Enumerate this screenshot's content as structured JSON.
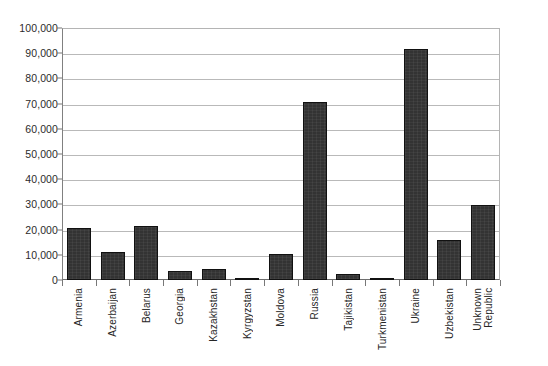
{
  "chart_data": {
    "type": "bar",
    "title": "",
    "subtitle": "",
    "xlabel": "",
    "ylabel": "",
    "ylim": [
      0,
      100000
    ],
    "ytick_step": 10000,
    "grid": true,
    "legend": "none",
    "orientation": "vertical",
    "bar_color": "#333333",
    "bar_border_color": "#111111",
    "gridline_color": "#b9b9b9",
    "axis_color": "#787878",
    "label_color": "#262626",
    "categories": [
      "Armenia",
      "Azerbaijan",
      "Belarus",
      "Georgia",
      "Kazakhstan",
      "Kyrgyzstan",
      "Moldova",
      "Russia",
      "Tajikistan",
      "Turkmenistan",
      "Ukraine",
      "Uzbekistan",
      "Unknown\nRepublic"
    ],
    "values": [
      20800,
      11200,
      21300,
      3700,
      4400,
      900,
      10300,
      70500,
      2500,
      400,
      91800,
      16000,
      29800
    ],
    "ytick_labels": [
      "100,000",
      "90,000",
      "80,000",
      "70,000",
      "60,000",
      "50,000",
      "40,000",
      "30,000",
      "20,000",
      "10,000",
      "0"
    ],
    "ytick_values": [
      100000,
      90000,
      80000,
      70000,
      60000,
      50000,
      40000,
      30000,
      20000,
      10000,
      0
    ]
  }
}
